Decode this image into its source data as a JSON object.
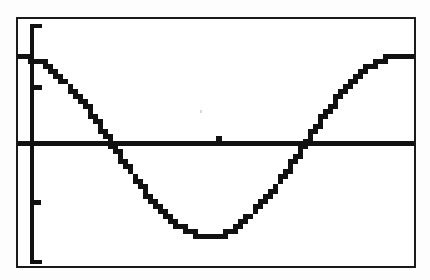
{
  "screen": {
    "device": "graphing-calculator",
    "label": "graph-screen",
    "background_color": "#ffffff",
    "ink_color": "#111111",
    "border_color": "#1a1a1a",
    "page_background": "#fdfdfd"
  },
  "chart_data": {
    "type": "line",
    "title": "",
    "subtitle": "",
    "xlabel": "",
    "ylabel": "",
    "legend": [],
    "legend_position": "none",
    "grid": false,
    "axes": {
      "x_axis_visible": true,
      "y_axis_visible": true,
      "x_axis_y_value": 0,
      "y_axis_x_value": 0,
      "xlim": [
        0,
        6.6
      ],
      "ylim": [
        -1.35,
        1.4
      ],
      "x_tick_labels": [],
      "y_tick_labels": [],
      "x_ticks": [
        3.14159
      ],
      "y_ticks": [
        -1,
        1
      ]
    },
    "series": [
      {
        "name": "y = cos(x)",
        "style": "stepped-pixel",
        "color": "#111111",
        "x": [
          0,
          0.105,
          0.209,
          0.314,
          0.419,
          0.524,
          0.628,
          0.733,
          0.838,
          0.942,
          1.047,
          1.152,
          1.257,
          1.361,
          1.466,
          1.571,
          1.676,
          1.78,
          1.885,
          1.99,
          2.094,
          2.199,
          2.304,
          2.409,
          2.513,
          2.618,
          2.723,
          2.827,
          2.932,
          3.037,
          3.142,
          3.246,
          3.351,
          3.456,
          3.56,
          3.665,
          3.77,
          3.875,
          3.979,
          4.084,
          4.189,
          4.294,
          4.398,
          4.503,
          4.608,
          4.712,
          4.817,
          4.922,
          5.027,
          5.131,
          5.236,
          5.341,
          5.445,
          5.55,
          5.655,
          5.76,
          5.864,
          5.969,
          6.074,
          6.178,
          6.283
        ],
        "y": [
          1.0,
          0.995,
          0.978,
          0.951,
          0.914,
          0.866,
          0.809,
          0.743,
          0.669,
          0.588,
          0.5,
          0.407,
          0.309,
          0.208,
          0.105,
          0.0,
          -0.105,
          -0.208,
          -0.309,
          -0.407,
          -0.5,
          -0.588,
          -0.669,
          -0.743,
          -0.809,
          -0.866,
          -0.914,
          -0.951,
          -0.978,
          -0.995,
          -1.0,
          -0.995,
          -0.978,
          -0.951,
          -0.914,
          -0.866,
          -0.809,
          -0.743,
          -0.669,
          -0.588,
          -0.5,
          -0.407,
          -0.309,
          -0.208,
          -0.105,
          0.0,
          0.105,
          0.208,
          0.309,
          0.407,
          0.5,
          0.588,
          0.669,
          0.743,
          0.809,
          0.866,
          0.914,
          0.951,
          0.978,
          0.995,
          1.0
        ]
      }
    ],
    "annotations": [
      {
        "name": "maximum-left",
        "x": 0,
        "y": 1
      },
      {
        "name": "zero-crossing-1",
        "x": 1.5708,
        "y": 0
      },
      {
        "name": "minimum",
        "x": 3.14159,
        "y": -1
      },
      {
        "name": "zero-crossing-2",
        "x": 4.7124,
        "y": 0
      },
      {
        "name": "maximum-right",
        "x": 6.28319,
        "y": 1
      }
    ]
  }
}
